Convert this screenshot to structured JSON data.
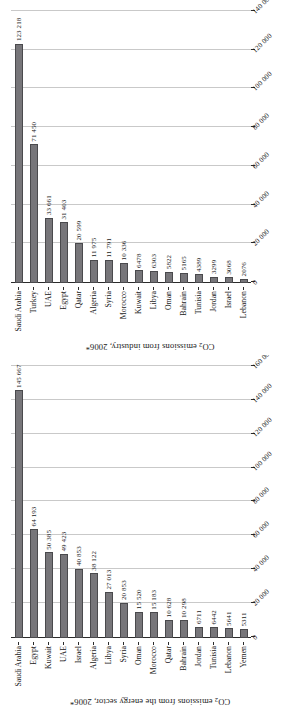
{
  "page": {
    "orientation": "rotated-90-ccw",
    "background": "#ffffff",
    "bar_color": "#77767a",
    "bar_border_color": "#4a4a4d",
    "gridline_color": "#c9c9c9",
    "axis_color": "#2b2b2b"
  },
  "charts": [
    {
      "id": "industry",
      "title_prefix": "CO",
      "title_sub": "2",
      "title_suffix": " emissions from industry, 2006*",
      "title_full": "CO2 emissions from industry, 2006*",
      "axis_ticks": [
        "0",
        "20 000",
        "40 000",
        "60 000",
        "80 000",
        "100 000",
        "120 000",
        "140 000"
      ],
      "categories": [
        "Saudi Arabia",
        "Turkey",
        "UAE",
        "Egypt",
        "Qatar",
        "Algeria",
        "Syria",
        "Morocco",
        "Kuwait",
        "Libya",
        "Oman",
        "Bahrain",
        "Tunisia",
        "Jordan",
        "Israel",
        "Lebanon"
      ],
      "value_labels": [
        "123 218",
        "71 450",
        "33 661",
        "31 403",
        "20 599",
        "11 975",
        "11 791",
        "10 336",
        "6478",
        "6303",
        "5822",
        "5165",
        "4389",
        "3299",
        "3068",
        "2076"
      ]
    },
    {
      "id": "energy",
      "title_prefix": "CO",
      "title_sub": "2",
      "title_suffix": " emissions from the energy sector, 2006*",
      "title_full": "CO2 emissions from the energy sector, 2006*",
      "axis_ticks": [
        "0",
        "20 000",
        "40 000",
        "60 000",
        "80 000",
        "100 000",
        "120 000",
        "140 000",
        "160 000"
      ],
      "categories": [
        "Saudi Arabia",
        "Egypt",
        "Kuwait",
        "UAE",
        "Israel",
        "Algeria",
        "Libya",
        "Syria",
        "Oman",
        "Morocco",
        "Qatar",
        "Bahrain",
        "Jordan",
        "Tunisia",
        "Lebanon",
        "Yemen"
      ],
      "value_labels": [
        "145 667",
        "64 193",
        "50 385",
        "49 423",
        "40 853",
        "38 122",
        "27 013",
        "20 853",
        "15 520",
        "15 183",
        "10 628",
        "10 298",
        "6711",
        "6442",
        "5641",
        "5311"
      ]
    }
  ],
  "chart_data": [
    {
      "type": "bar",
      "id": "industry",
      "orientation": "horizontal",
      "title": "CO2 emissions from industry, 2006*",
      "xlabel": "",
      "ylabel": "",
      "xlim": [
        0,
        140000
      ],
      "grid": true,
      "legend": "none",
      "tick_step": 20000,
      "tick_labels": [
        "0",
        "20 000",
        "40 000",
        "60 000",
        "80 000",
        "100 000",
        "120 000",
        "140 000"
      ],
      "categories": [
        "Saudi Arabia",
        "Turkey",
        "UAE",
        "Egypt",
        "Qatar",
        "Algeria",
        "Syria",
        "Morocco",
        "Kuwait",
        "Libya",
        "Oman",
        "Bahrain",
        "Tunisia",
        "Jordan",
        "Israel",
        "Lebanon"
      ],
      "values": [
        123218,
        71450,
        33661,
        31403,
        20599,
        11975,
        11791,
        10336,
        6478,
        6303,
        5822,
        5165,
        4389,
        3299,
        3068,
        2076
      ],
      "data_labels": [
        "123 218",
        "71 450",
        "33 661",
        "31 403",
        "20 599",
        "11 975",
        "11 791",
        "10 336",
        "6478",
        "6303",
        "5822",
        "5165",
        "4389",
        "3299",
        "3068",
        "2076"
      ]
    },
    {
      "type": "bar",
      "id": "energy",
      "orientation": "horizontal",
      "title": "CO2 emissions from the energy sector, 2006*",
      "xlabel": "",
      "ylabel": "",
      "xlim": [
        0,
        160000
      ],
      "grid": true,
      "legend": "none",
      "tick_step": 20000,
      "tick_labels": [
        "0",
        "20 000",
        "40 000",
        "60 000",
        "80 000",
        "100 000",
        "120 000",
        "140 000",
        "160 000"
      ],
      "categories": [
        "Saudi Arabia",
        "Egypt",
        "Kuwait",
        "UAE",
        "Israel",
        "Algeria",
        "Libya",
        "Syria",
        "Oman",
        "Morocco",
        "Qatar",
        "Bahrain",
        "Jordan",
        "Tunisia",
        "Lebanon",
        "Yemen"
      ],
      "values": [
        145667,
        64193,
        50385,
        49423,
        40853,
        38122,
        27013,
        20853,
        15520,
        15183,
        10628,
        10298,
        6711,
        6442,
        5641,
        5311
      ],
      "data_labels": [
        "145 667",
        "64 193",
        "50 385",
        "49 423",
        "40 853",
        "38 122",
        "27 013",
        "20 853",
        "15 520",
        "15 183",
        "10 628",
        "10 298",
        "6711",
        "6442",
        "5641",
        "5311"
      ]
    }
  ]
}
